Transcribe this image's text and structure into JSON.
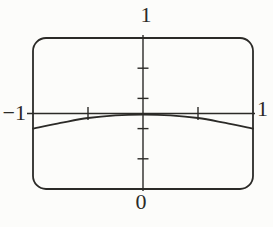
{
  "figure": {
    "kind": "graphing-calculator-screen"
  },
  "chart_data": {
    "type": "line",
    "title": "",
    "xlabel": "",
    "ylabel": "",
    "x_range": [
      -1,
      1
    ],
    "y_range": [
      -1,
      1
    ],
    "x_ticks": [
      -0.5,
      0.5
    ],
    "y_ticks": [
      0.6,
      0.2,
      -0.2,
      -0.6
    ],
    "axis_labels": {
      "top": "1",
      "bottom": "0",
      "left": "−1",
      "right": "1"
    },
    "grid": false,
    "legend": false,
    "series": [
      {
        "name": "curve",
        "x": [
          -1,
          -0.75,
          -0.5,
          -0.25,
          0,
          0.25,
          0.5,
          0.75,
          1
        ],
        "y": [
          -0.2,
          -0.125,
          -0.06,
          -0.025,
          -0.015,
          -0.025,
          -0.06,
          -0.125,
          -0.2
        ]
      }
    ]
  },
  "colors": {
    "ink": "#2b2a27",
    "background": "#fcfcfa"
  }
}
